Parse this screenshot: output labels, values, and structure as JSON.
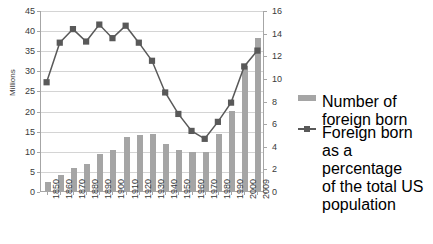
{
  "chart_data": {
    "type": "bar",
    "title": "",
    "categories": [
      "1850",
      "1860",
      "1870",
      "1880",
      "1890",
      "1900",
      "1910",
      "1920",
      "1930",
      "1940",
      "1950",
      "1960",
      "1970",
      "1980",
      "1990",
      "2000",
      "2009"
    ],
    "series": [
      {
        "name": "Number of foreign born",
        "type": "bar",
        "axis": "left",
        "unit": "Millions",
        "values": [
          2.2,
          4.1,
          5.6,
          6.7,
          9.2,
          10.3,
          13.5,
          13.9,
          14.2,
          11.6,
          10.3,
          9.7,
          9.6,
          14.1,
          19.8,
          31.1,
          38.0
        ]
      },
      {
        "name": "Foreign born as a percentage of the total US population",
        "type": "line",
        "axis": "right",
        "unit": "%",
        "values": [
          9.7,
          13.2,
          14.4,
          13.3,
          14.8,
          13.6,
          14.7,
          13.2,
          11.6,
          8.8,
          6.9,
          5.4,
          4.7,
          6.2,
          7.9,
          11.1,
          12.5
        ]
      }
    ],
    "xlabel": "",
    "ylabel": "Millions",
    "ylabel_right": "",
    "ylim": [
      0,
      45
    ],
    "ylim_right": [
      0,
      16
    ],
    "yticks": [
      0,
      5,
      10,
      15,
      20,
      25,
      30,
      35,
      40,
      45
    ],
    "yticks_right": [
      0,
      2,
      4,
      6,
      8,
      10,
      12,
      14,
      16
    ],
    "grid": true,
    "legend_position": "right",
    "colors": {
      "bar": "#a5a5a5",
      "line": "#595959",
      "grid": "#d4d4d4",
      "axis": "#a6a6a6",
      "text": "#3a3a3a"
    }
  },
  "legend": {
    "entries": [
      {
        "label": "Number of foreign born",
        "marker": "bar-swatch"
      },
      {
        "label": "Foreign born as a percentage\nof the total US population",
        "marker": "line-marker-swatch"
      }
    ]
  },
  "axis_titles": {
    "left": "Millions"
  }
}
